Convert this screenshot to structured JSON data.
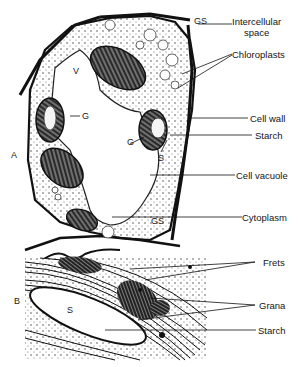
{
  "figure": {
    "panel_a": {
      "letter": "A",
      "inner_tags": {
        "v": "V",
        "g_left": "G",
        "g_right": "G",
        "s": "S",
        "gs_top": "GS",
        "gs_bottom": "GS"
      },
      "labels": {
        "intercellular": [
          "Intercellular",
          "space"
        ],
        "chloroplasts": "Chloroplasts",
        "cell_wall": "Cell wall",
        "starch": "Starch",
        "cell_vacuole": "Cell vacuole",
        "cytoplasm": "Cytoplasm"
      }
    },
    "panel_b": {
      "letter": "B",
      "inner_tags": {
        "s": "S"
      },
      "labels": {
        "frets": "Frets",
        "grana": "Grana",
        "starch": "Starch"
      }
    }
  }
}
